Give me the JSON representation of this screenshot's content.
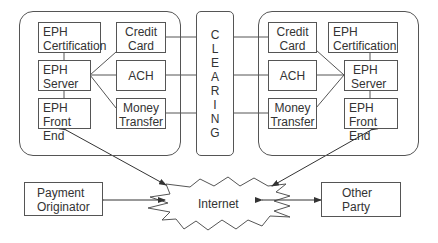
{
  "left_system": {
    "eph_certification": [
      "EPH",
      "Certification"
    ],
    "credit_card": [
      "Credit",
      "Card"
    ],
    "eph_server": [
      "EPH",
      "Server"
    ],
    "ach": [
      "ACH"
    ],
    "eph_front_end": [
      "EPH",
      "Front End"
    ],
    "money_transfer": [
      "Money",
      "Transfer"
    ]
  },
  "clearing": {
    "label": "CLEARING",
    "letters": [
      "C",
      "L",
      "E",
      "A",
      "R",
      "I",
      "N",
      "G"
    ]
  },
  "right_system": {
    "credit_card": [
      "Credit",
      "Card"
    ],
    "eph_certification": [
      "EPH",
      "Certification"
    ],
    "ach": [
      "ACH"
    ],
    "eph_server": [
      "EPH",
      "Server"
    ],
    "money_transfer": [
      "Money",
      "Transfer"
    ],
    "eph_front_end": [
      "EPH",
      "Front End"
    ]
  },
  "payment_originator": [
    "Payment",
    "Originator"
  ],
  "other_party": [
    "Other",
    "Party"
  ],
  "internet": "Internet",
  "colors": {
    "stroke": "#555555",
    "text": "#333333",
    "background": "#ffffff"
  }
}
